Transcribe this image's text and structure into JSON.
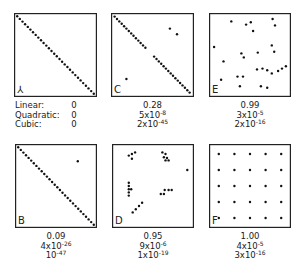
{
  "chart_data": {
    "type": "scatter",
    "title": "",
    "legend_labels": [
      "Linear:",
      "Quadratic:",
      "Cubic:"
    ],
    "panels": [
      {
        "label": "A",
        "label_glyph": "⅄",
        "box": {
          "x": 14,
          "y": 13,
          "w": 83,
          "h": 84
        },
        "stats": {
          "linear": "0",
          "quadratic": "0",
          "cubic": "0"
        },
        "stats_display": [
          {
            "base": "0",
            "exp": ""
          },
          {
            "base": "0",
            "exp": ""
          },
          {
            "base": "0",
            "exp": ""
          }
        ],
        "points": "diagonal_30"
      },
      {
        "label": "C",
        "label_glyph": "C",
        "box": {
          "x": 111,
          "y": 13,
          "w": 83,
          "h": 84
        },
        "stats": {
          "linear": "0.28",
          "quadratic": "5x10^-8",
          "cubic": "2x10^-45"
        },
        "stats_display": [
          {
            "base": "0.28",
            "exp": ""
          },
          {
            "base": "5x10",
            "exp": "-8"
          },
          {
            "base": "2x10",
            "exp": "-45"
          }
        ],
        "points": [
          [
            0.02,
            0.02
          ],
          [
            0.05,
            0.05
          ],
          [
            0.08,
            0.08
          ],
          [
            0.11,
            0.11
          ],
          [
            0.14,
            0.14
          ],
          [
            0.17,
            0.17
          ],
          [
            0.2,
            0.2
          ],
          [
            0.23,
            0.23
          ],
          [
            0.26,
            0.26
          ],
          [
            0.29,
            0.29
          ],
          [
            0.32,
            0.32
          ],
          [
            0.35,
            0.35
          ],
          [
            0.38,
            0.38
          ],
          [
            0.41,
            0.41
          ],
          [
            0.52,
            0.52
          ],
          [
            0.55,
            0.55
          ],
          [
            0.58,
            0.58
          ],
          [
            0.61,
            0.61
          ],
          [
            0.64,
            0.64
          ],
          [
            0.67,
            0.67
          ],
          [
            0.7,
            0.7
          ],
          [
            0.73,
            0.73
          ],
          [
            0.76,
            0.76
          ],
          [
            0.79,
            0.79
          ],
          [
            0.82,
            0.82
          ],
          [
            0.85,
            0.85
          ],
          [
            0.88,
            0.88
          ],
          [
            0.91,
            0.91
          ],
          [
            0.94,
            0.94
          ],
          [
            0.97,
            0.97
          ],
          [
            0.72,
            0.17
          ],
          [
            0.81,
            0.24
          ],
          [
            0.17,
            0.8
          ]
        ]
      },
      {
        "label": "E",
        "label_glyph": "E",
        "box": {
          "x": 209,
          "y": 13,
          "w": 82,
          "h": 84
        },
        "stats": {
          "linear": "0.99",
          "quadratic": "3x10^-5",
          "cubic": "2x10^-16"
        },
        "stats_display": [
          {
            "base": "0.99",
            "exp": ""
          },
          {
            "base": "3x10",
            "exp": "-5"
          },
          {
            "base": "2x10",
            "exp": "-16"
          }
        ],
        "points": [
          [
            0.26,
            0.08
          ],
          [
            0.45,
            0.12
          ],
          [
            0.51,
            0.09
          ],
          [
            0.54,
            0.2
          ],
          [
            0.79,
            0.05
          ],
          [
            0.82,
            0.13
          ],
          [
            0.04,
            0.4
          ],
          [
            0.39,
            0.48
          ],
          [
            0.42,
            0.53
          ],
          [
            0.6,
            0.47
          ],
          [
            0.78,
            0.38
          ],
          [
            0.81,
            0.46
          ],
          [
            0.16,
            0.58
          ],
          [
            0.59,
            0.68
          ],
          [
            0.66,
            0.67
          ],
          [
            0.72,
            0.69
          ],
          [
            0.78,
            0.73
          ],
          [
            0.86,
            0.7
          ],
          [
            0.91,
            0.67
          ],
          [
            0.96,
            0.64
          ],
          [
            0.34,
            0.77
          ],
          [
            0.41,
            0.77
          ],
          [
            0.13,
            0.81
          ],
          [
            0.37,
            0.89
          ],
          [
            0.64,
            0.89
          ],
          [
            0.72,
            0.91
          ]
        ]
      },
      {
        "label": "B",
        "label_glyph": "B",
        "box": {
          "x": 15,
          "y": 144,
          "w": 82,
          "h": 84
        },
        "stats": {
          "linear": "0.09",
          "quadratic": "4x10^-26",
          "cubic": "10^-47"
        },
        "stats_display": [
          {
            "base": "0.09",
            "exp": ""
          },
          {
            "base": "4x10",
            "exp": "-26"
          },
          {
            "base": "10",
            "exp": "-47"
          }
        ],
        "points": "diagonal_30_plus",
        "extra_points": [
          [
            0.78,
            0.19
          ]
        ]
      },
      {
        "label": "D",
        "label_glyph": "D",
        "box": {
          "x": 112,
          "y": 144,
          "w": 82,
          "h": 84
        },
        "stats": {
          "linear": "0.95",
          "quadratic": "9x10^-6",
          "cubic": "1x10^-19"
        },
        "stats_display": [
          {
            "base": "0.95",
            "exp": ""
          },
          {
            "base": "9x10",
            "exp": "-6"
          },
          {
            "base": "1x10",
            "exp": "-19"
          }
        ],
        "points": [
          [
            0.19,
            0.12
          ],
          [
            0.23,
            0.1
          ],
          [
            0.27,
            0.08
          ],
          [
            0.23,
            0.16
          ],
          [
            0.62,
            0.08
          ],
          [
            0.66,
            0.1
          ],
          [
            0.64,
            0.14
          ],
          [
            0.68,
            0.15
          ],
          [
            0.66,
            0.18
          ],
          [
            0.7,
            0.18
          ],
          [
            0.94,
            0.3
          ],
          [
            0.19,
            0.46
          ],
          [
            0.19,
            0.5
          ],
          [
            0.19,
            0.54
          ],
          [
            0.22,
            0.54
          ],
          [
            0.19,
            0.58
          ],
          [
            0.19,
            0.62
          ],
          [
            0.6,
            0.6
          ],
          [
            0.64,
            0.6
          ],
          [
            0.65,
            0.55
          ],
          [
            0.7,
            0.55
          ],
          [
            0.74,
            0.55
          ],
          [
            0.36,
            0.71
          ],
          [
            0.32,
            0.75
          ],
          [
            0.28,
            0.79
          ],
          [
            0.24,
            0.83
          ]
        ]
      },
      {
        "label": "F",
        "label_glyph": "F",
        "box": {
          "x": 209,
          "y": 144,
          "w": 82,
          "h": 84
        },
        "stats": {
          "linear": "1.00",
          "quadratic": "4x10^-5",
          "cubic": "3x10^-16"
        },
        "stats_display": [
          {
            "base": "1.00",
            "exp": ""
          },
          {
            "base": "4x10",
            "exp": "-5"
          },
          {
            "base": "3x10",
            "exp": "-16"
          }
        ],
        "points": "grid_5x5"
      }
    ]
  }
}
